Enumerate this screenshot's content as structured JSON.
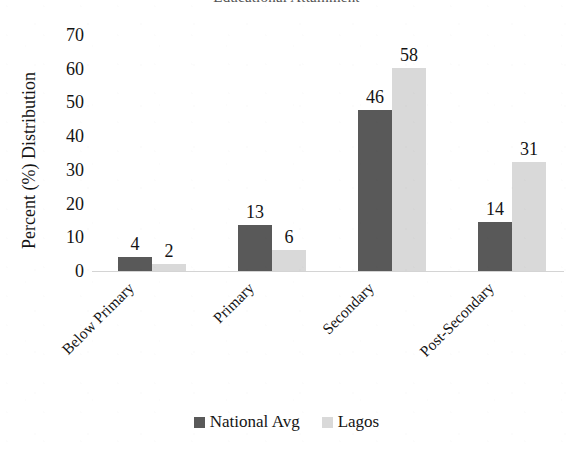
{
  "chart_data": {
    "type": "bar",
    "title": "Educational Attainment",
    "title_clipped": true,
    "categories": [
      "Below Primary",
      "Primary",
      "Secondary",
      "Post-Secondary"
    ],
    "series": [
      {
        "name": "National Avg",
        "color": "#595959",
        "values": [
          4,
          13,
          46,
          14
        ]
      },
      {
        "name": "Lagos",
        "color": "#d9d9d9",
        "values": [
          2,
          6,
          58,
          31
        ]
      }
    ],
    "xlabel": "",
    "ylabel": "Percent (%) Distribution",
    "ylim": [
      0,
      70
    ],
    "yticks": [
      0,
      10,
      20,
      30,
      40,
      50,
      60,
      70
    ],
    "grid": false,
    "legend_position": "bottom",
    "data_labels": true
  },
  "axis": {
    "y_title": "Percent (%) Distribution",
    "y_tick_labels": [
      "70",
      "60",
      "50",
      "40",
      "30",
      "20",
      "10",
      "0"
    ]
  },
  "legend": {
    "items": [
      {
        "label": "National Avg",
        "color": "#595959"
      },
      {
        "label": "Lagos",
        "color": "#d9d9d9"
      }
    ]
  }
}
